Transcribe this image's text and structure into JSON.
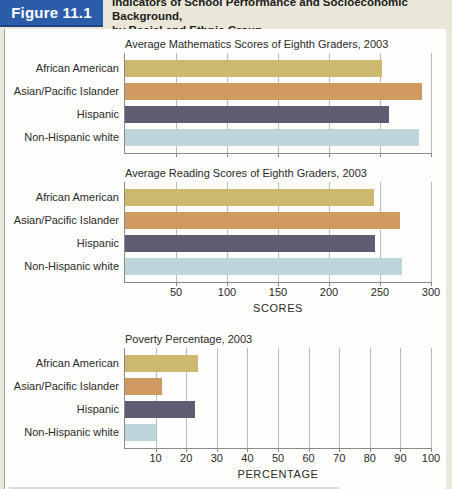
{
  "figure": {
    "badge": "Figure 11.1",
    "title_line1": "Indicators of School Performance and Socioeconomic Background,",
    "title_line2": "by Racial and Ethnic Group"
  },
  "colors": {
    "badge_bg": "#2a5ca9",
    "header_bg": "#ebe7d8",
    "page_bg": "#e7e9da",
    "gridline": "#bcbcbc",
    "axis": "#8a8a8a",
    "bar_colors": [
      "#ccb96d",
      "#cf9a62",
      "#5e5b73",
      "#bdd5db"
    ]
  },
  "chart_data": [
    {
      "id": "math-scores",
      "type": "bar",
      "orientation": "horizontal",
      "title": "Average Mathematics Scores of Eighth Graders, 2003",
      "categories": [
        "African American",
        "Asian/Pacific Islander",
        "Hispanic",
        "Non-Hispanic white"
      ],
      "values": [
        252,
        291,
        259,
        288
      ],
      "xlim": [
        0,
        300
      ],
      "xticks": [
        50,
        100,
        150,
        200,
        250,
        300
      ],
      "show_tick_labels": false,
      "xlabel": "",
      "grid": true,
      "legend": "none"
    },
    {
      "id": "reading-scores",
      "type": "bar",
      "orientation": "horizontal",
      "title": "Average Reading Scores of Eighth Graders, 2003",
      "categories": [
        "African American",
        "Asian/Pacific Islander",
        "Hispanic",
        "Non-Hispanic white"
      ],
      "values": [
        244,
        270,
        245,
        272
      ],
      "xlim": [
        0,
        300
      ],
      "xticks": [
        50,
        100,
        150,
        200,
        250,
        300
      ],
      "show_tick_labels": true,
      "xlabel": "SCORES",
      "grid": true,
      "legend": "none"
    },
    {
      "id": "poverty-percentage",
      "type": "bar",
      "orientation": "horizontal",
      "title": "Poverty Percentage, 2003",
      "categories": [
        "African American",
        "Asian/Pacific Islander",
        "Hispanic",
        "Non-Hispanic white"
      ],
      "values": [
        24,
        12,
        23,
        10
      ],
      "xlim": [
        0,
        100
      ],
      "xticks": [
        10,
        20,
        30,
        40,
        50,
        60,
        70,
        80,
        90,
        100
      ],
      "show_tick_labels": true,
      "xlabel": "PERCENTAGE",
      "grid": true,
      "legend": "none"
    }
  ]
}
